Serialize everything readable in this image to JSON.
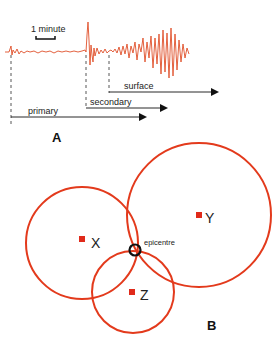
{
  "panel_a": {
    "label": "A",
    "scale_label": "1 minute",
    "waves": [
      {
        "name": "primary",
        "label": "primary"
      },
      {
        "name": "secondary",
        "label": "secondary"
      },
      {
        "name": "surface",
        "label": "surface"
      }
    ]
  },
  "panel_b": {
    "label": "B",
    "stations": [
      {
        "id": "X",
        "label": "X"
      },
      {
        "id": "Y",
        "label": "Y"
      },
      {
        "id": "Z",
        "label": "Z"
      }
    ],
    "epicentre_label": "epicentre"
  },
  "colors": {
    "trace": "#e0502a",
    "circle": "#e33a1c",
    "station": "#e02a1a",
    "arrow": "#111111",
    "epicentre_marker": "#111111"
  }
}
